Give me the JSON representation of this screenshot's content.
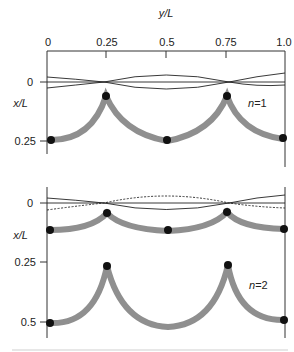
{
  "figure": {
    "top_axis": {
      "title": "y/L",
      "ticks": [
        "0",
        "0.25",
        "0.5",
        "0.75",
        "1.0"
      ]
    },
    "panel_n1": {
      "label": "n=1",
      "y_axis_title": "x/L",
      "y_ticks": [
        "0",
        "0.25"
      ],
      "curves": "three thin sinusoidal lines crossing at y/L=0.25 and 0.75 near x/L=0; thick gray cycloid-like arcs with cusps at y/L=0.25 and 0.75",
      "nodes_yL": [
        0,
        0.25,
        0.5,
        0.75,
        1.0
      ]
    },
    "panel_n2": {
      "label": "n=2",
      "y_axis_title": "x/L",
      "y_ticks": [
        "0",
        "0.25",
        "0.5"
      ],
      "curves": "thin solid and dashed sinusoidal lines near x/L=0; two gray arc chains, shallow near x/L~0.1 and deep between x/L 0.25 and 0.5",
      "nodes_yL": [
        0,
        0.25,
        0.5,
        0.75,
        1.0
      ]
    }
  }
}
